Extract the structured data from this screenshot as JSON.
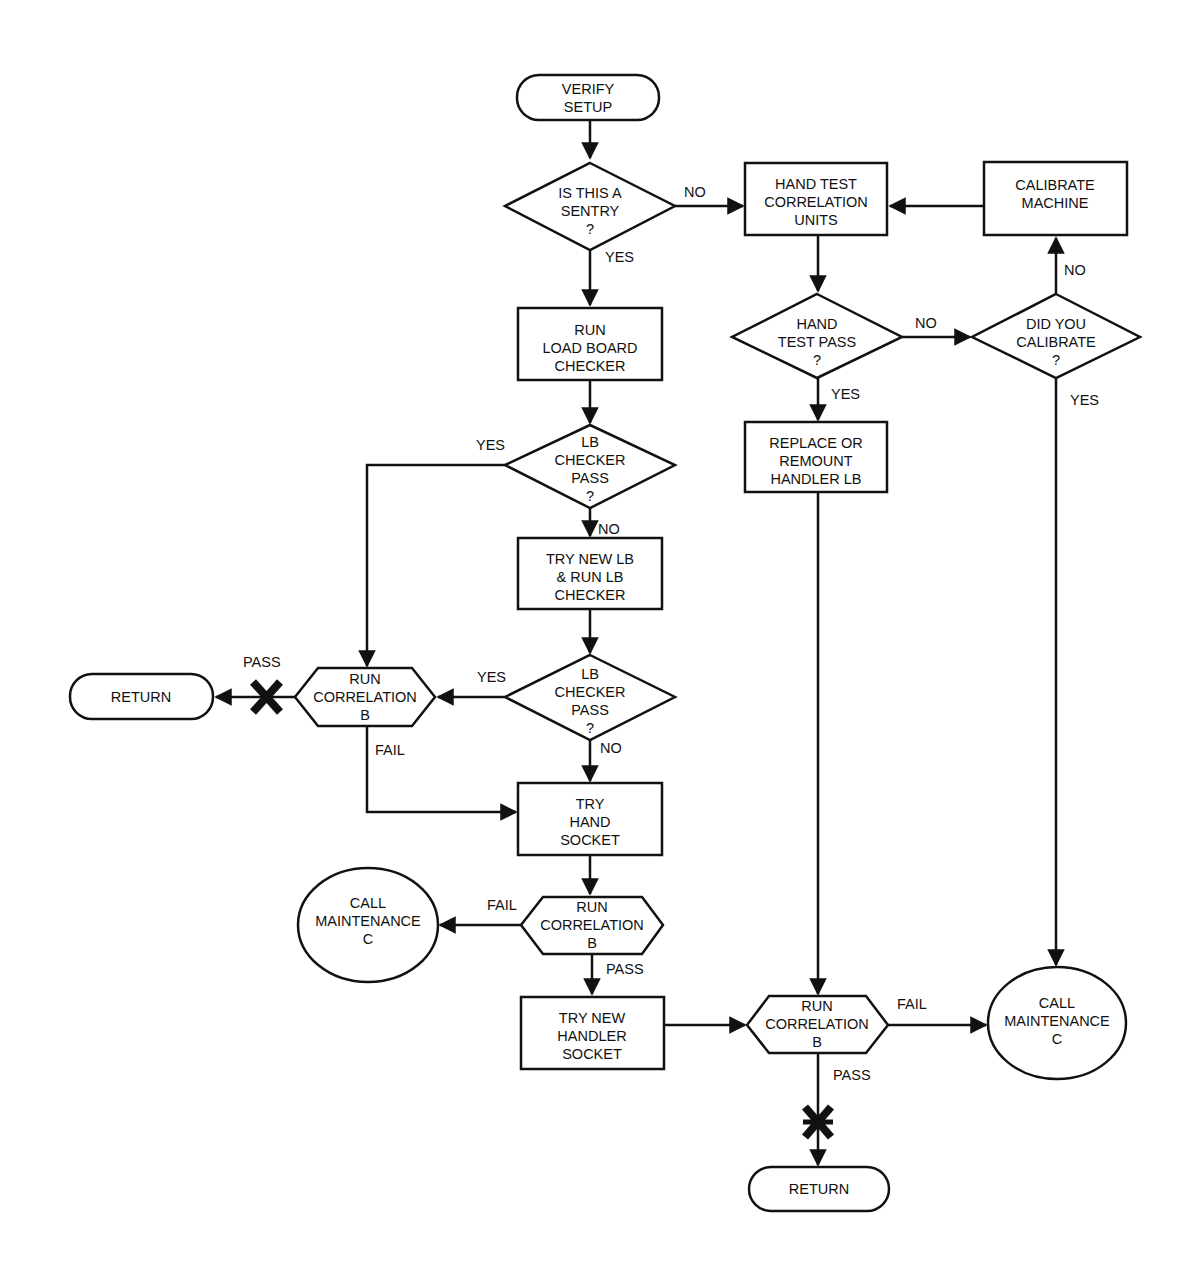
{
  "diagram": {
    "type": "flowchart",
    "colors": {
      "stroke": "#111111",
      "fill": "#ffffff",
      "background": "#ffffff"
    },
    "nodes": {
      "verify_setup": {
        "shape": "terminal",
        "lines": [
          "VERIFY",
          "SETUP"
        ]
      },
      "is_sentry": {
        "shape": "decision",
        "lines": [
          "IS THIS A",
          "SENTRY",
          "?"
        ]
      },
      "hand_test_units": {
        "shape": "process",
        "lines": [
          "HAND TEST",
          "CORRELATION",
          "UNITS"
        ]
      },
      "calibrate_machine": {
        "shape": "process",
        "lines": [
          "CALIBRATE",
          "MACHINE"
        ]
      },
      "run_lb_checker": {
        "shape": "process",
        "lines": [
          "RUN",
          "LOAD BOARD",
          "CHECKER"
        ]
      },
      "hand_test_pass": {
        "shape": "decision",
        "lines": [
          "HAND",
          "TEST PASS",
          "?"
        ]
      },
      "did_you_calibrate": {
        "shape": "decision",
        "lines": [
          "DID YOU",
          "CALIBRATE",
          "?"
        ]
      },
      "lb_checker_pass_1": {
        "shape": "decision",
        "lines": [
          "LB",
          "CHECKER",
          "PASS",
          "?"
        ]
      },
      "replace_remount": {
        "shape": "process",
        "lines": [
          "REPLACE OR",
          "REMOUNT",
          "HANDLER LB"
        ]
      },
      "try_new_lb": {
        "shape": "process",
        "lines": [
          "TRY NEW LB",
          "& RUN LB",
          "CHECKER"
        ]
      },
      "return_left": {
        "shape": "terminal",
        "lines": [
          "RETURN"
        ]
      },
      "run_correlation_1": {
        "shape": "hexagon",
        "lines": [
          "RUN",
          "CORRELATION",
          "B"
        ]
      },
      "lb_checker_pass_2": {
        "shape": "decision",
        "lines": [
          "LB",
          "CHECKER",
          "PASS",
          "?"
        ]
      },
      "try_hand_socket": {
        "shape": "process",
        "lines": [
          "TRY",
          "HAND",
          "SOCKET"
        ]
      },
      "call_maintenance_left": {
        "shape": "ellipse",
        "lines": [
          "CALL",
          "MAINTENANCE",
          "C"
        ]
      },
      "run_correlation_2": {
        "shape": "hexagon",
        "lines": [
          "RUN",
          "CORRELATION",
          "B"
        ]
      },
      "try_new_handler_socket": {
        "shape": "process",
        "lines": [
          "TRY NEW",
          "HANDLER",
          "SOCKET"
        ]
      },
      "run_correlation_3": {
        "shape": "hexagon",
        "lines": [
          "RUN",
          "CORRELATION",
          "B"
        ]
      },
      "call_maintenance_right": {
        "shape": "ellipse",
        "lines": [
          "CALL",
          "MAINTENANCE",
          "C"
        ]
      },
      "return_bottom": {
        "shape": "terminal",
        "lines": [
          "RETURN"
        ]
      }
    },
    "edge_labels": {
      "sentry_no": "NO",
      "sentry_yes": "YES",
      "hand_test_no": "NO",
      "hand_test_yes": "YES",
      "calibrate_no": "NO",
      "calibrate_yes": "YES",
      "lb1_yes": "YES",
      "lb1_no": "NO",
      "lb2_yes": "YES",
      "lb2_no": "NO",
      "corr1_pass": "PASS",
      "corr1_fail": "FAIL",
      "corr2_fail": "FAIL",
      "corr2_pass": "PASS",
      "corr3_fail": "FAIL",
      "corr3_pass": "PASS"
    },
    "edges": [
      {
        "from": "verify_setup",
        "to": "is_sentry"
      },
      {
        "from": "is_sentry",
        "to": "hand_test_units",
        "label": "NO"
      },
      {
        "from": "is_sentry",
        "to": "run_lb_checker",
        "label": "YES"
      },
      {
        "from": "calibrate_machine",
        "to": "hand_test_units"
      },
      {
        "from": "hand_test_units",
        "to": "hand_test_pass"
      },
      {
        "from": "hand_test_pass",
        "to": "did_you_calibrate",
        "label": "NO"
      },
      {
        "from": "hand_test_pass",
        "to": "replace_remount",
        "label": "YES"
      },
      {
        "from": "did_you_calibrate",
        "to": "calibrate_machine",
        "label": "NO"
      },
      {
        "from": "did_you_calibrate",
        "to": "call_maintenance_right",
        "label": "YES"
      },
      {
        "from": "run_lb_checker",
        "to": "lb_checker_pass_1"
      },
      {
        "from": "lb_checker_pass_1",
        "to": "run_correlation_1",
        "label": "YES"
      },
      {
        "from": "lb_checker_pass_1",
        "to": "try_new_lb",
        "label": "NO"
      },
      {
        "from": "try_new_lb",
        "to": "lb_checker_pass_2"
      },
      {
        "from": "lb_checker_pass_2",
        "to": "run_correlation_1",
        "label": "YES"
      },
      {
        "from": "lb_checker_pass_2",
        "to": "try_hand_socket",
        "label": "NO"
      },
      {
        "from": "run_correlation_1",
        "to": "return_left",
        "label": "PASS"
      },
      {
        "from": "run_correlation_1",
        "to": "try_hand_socket",
        "label": "FAIL"
      },
      {
        "from": "try_hand_socket",
        "to": "run_correlation_2"
      },
      {
        "from": "run_correlation_2",
        "to": "call_maintenance_left",
        "label": "FAIL"
      },
      {
        "from": "run_correlation_2",
        "to": "try_new_handler_socket",
        "label": "PASS"
      },
      {
        "from": "try_new_handler_socket",
        "to": "run_correlation_3"
      },
      {
        "from": "replace_remount",
        "to": "run_correlation_3"
      },
      {
        "from": "run_correlation_3",
        "to": "call_maintenance_right",
        "label": "FAIL"
      },
      {
        "from": "run_correlation_3",
        "to": "return_bottom",
        "label": "PASS"
      }
    ]
  }
}
